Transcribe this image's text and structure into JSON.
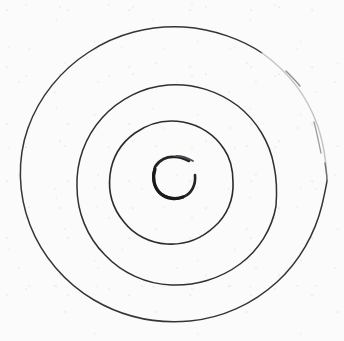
{
  "canvas": {
    "width": 344,
    "height": 341,
    "background_color": "#fbfbfc",
    "media": "scanned paper"
  },
  "drawing": {
    "title": "hand-drawn concentric spiral",
    "subject": "four nested roughly-circular rings drawn by hand, forming a spiral / bullseye",
    "ink_color": "#2b2b2e",
    "faded_ink_color": "#c2c4c9",
    "center": {
      "x": 174,
      "y": 176
    },
    "rings": [
      {
        "name": "outer-ring",
        "index": 1,
        "radius_x": 153,
        "radius_y": 148,
        "stroke_width": 1.5,
        "stroke_color": "#34343a",
        "note": "outermost loop; upper-right quadrant fades to very light gray where the pen lifted"
      },
      {
        "name": "second-ring",
        "index": 2,
        "radius_x": 104,
        "radius_y": 101,
        "stroke_width": 1.5,
        "stroke_color": "#2f2f35",
        "note": "continuous dark loop"
      },
      {
        "name": "third-ring",
        "index": 3,
        "radius_x": 60,
        "radius_y": 58,
        "stroke_width": 1.6,
        "stroke_color": "#2b2b30",
        "note": "continuous dark loop"
      },
      {
        "name": "inner-ring",
        "index": 4,
        "radius_x": 21,
        "radius_y": 20,
        "stroke_width": 2.6,
        "stroke_color": "#232328",
        "note": "small heavy circle at the centre, open with a gap on the upper-right side"
      }
    ]
  }
}
